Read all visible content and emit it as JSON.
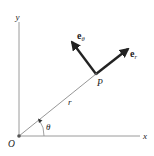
{
  "diagram": {
    "labels": {
      "y_axis": "y",
      "x_axis": "x",
      "origin": "O",
      "point": "P",
      "radius": "r",
      "angle": "θ",
      "e_r_base": "e",
      "e_r_sub": "r",
      "e_theta_base": "e",
      "e_theta_sub": "θ"
    },
    "colors": {
      "axis": "#9a9a9a",
      "vector": "#222222",
      "text": "#222222"
    }
  }
}
